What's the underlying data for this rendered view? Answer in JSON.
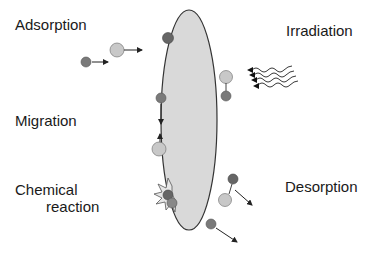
{
  "diagram": {
    "type": "surface-processes",
    "labels": {
      "adsorption": "Adsorption",
      "irradiation": "Irradiation",
      "migration": "Migration",
      "chemical_line1": "Chemical",
      "chemical_line2": "reaction",
      "desorption": "Desorption"
    },
    "colors": {
      "surface_fill": "#d9d9d9",
      "surface_stroke": "#333333",
      "dark_particle": "#7a7a7a",
      "light_particle": "#c8c8c8",
      "text": "#1a1a1a"
    }
  }
}
